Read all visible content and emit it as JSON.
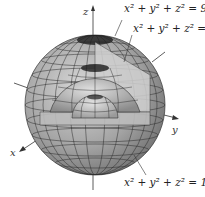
{
  "diagram": {
    "axes": {
      "x": "x",
      "y": "y",
      "z": "z"
    },
    "labels": [
      {
        "id": "outer",
        "lhs": "x² + y² + z²",
        "rhs": "= 9"
      },
      {
        "id": "middle",
        "lhs": "x² + y² + z²",
        "rhs": "= 4"
      },
      {
        "id": "inner",
        "lhs": "x² + y² + z²",
        "rhs": "= 1"
      }
    ],
    "spheres": [
      {
        "name": "outer",
        "radius": 3
      },
      {
        "name": "middle",
        "radius": 2
      },
      {
        "name": "inner",
        "radius": 1
      }
    ],
    "colors": {
      "surface": "#a8a8a8",
      "mesh": "#2a2a2a",
      "cut": "#cfcfcf"
    }
  }
}
